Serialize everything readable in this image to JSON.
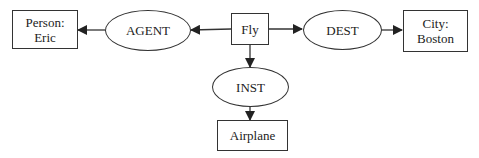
{
  "diagram": {
    "type": "semantic-case-frame",
    "nodes": {
      "person": {
        "label": "Person:\nEric",
        "shape": "rect"
      },
      "agent": {
        "label": "AGENT",
        "shape": "ellipse"
      },
      "fly": {
        "label": "Fly",
        "shape": "rect"
      },
      "dest": {
        "label": "DEST",
        "shape": "ellipse"
      },
      "city": {
        "label": "City:\nBoston",
        "shape": "rect"
      },
      "inst": {
        "label": "INST",
        "shape": "ellipse"
      },
      "airplane": {
        "label": "Airplane",
        "shape": "rect"
      }
    },
    "edges": [
      {
        "from": "fly",
        "to": "agent"
      },
      {
        "from": "agent",
        "to": "person"
      },
      {
        "from": "fly",
        "to": "dest"
      },
      {
        "from": "dest",
        "to": "city"
      },
      {
        "from": "fly",
        "to": "inst"
      },
      {
        "from": "inst",
        "to": "airplane"
      }
    ],
    "colors": {
      "stroke": "#333333",
      "background": "#ffffff",
      "text": "#222222"
    }
  }
}
